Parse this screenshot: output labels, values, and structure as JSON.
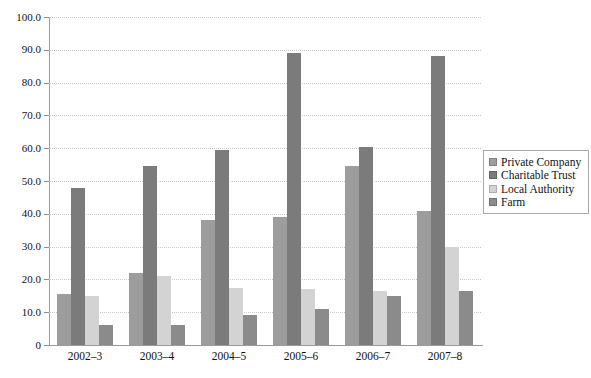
{
  "chart_data": {
    "type": "bar",
    "title": "",
    "subtitle": "",
    "xlabel": "",
    "ylabel": "",
    "categories": [
      "2002–3",
      "2003–4",
      "2004–5",
      "2005–6",
      "2006–7",
      "2007–8"
    ],
    "series": [
      {
        "name": "Private Company",
        "color": "#9d9d9d",
        "values": [
          15.5,
          22.0,
          38.0,
          39.0,
          54.5,
          41.0
        ]
      },
      {
        "name": "Charitable Trust",
        "color": "#7b7b7b",
        "values": [
          48.0,
          54.5,
          59.5,
          89.0,
          60.5,
          88.0
        ]
      },
      {
        "name": "Local Authority",
        "color": "#d3d3d3",
        "values": [
          15.0,
          21.0,
          17.5,
          17.0,
          16.5,
          30.0
        ]
      },
      {
        "name": "Farm",
        "color": "#8b8b8b",
        "values": [
          6.0,
          6.0,
          9.0,
          11.0,
          15.0,
          16.5
        ]
      }
    ],
    "ylim": [
      0,
      100
    ],
    "yticks": [
      0,
      10,
      20,
      30,
      40,
      50,
      60,
      70,
      80,
      90,
      100
    ],
    "ytick_labels": [
      "0",
      "10.0",
      "20.0",
      "30.0",
      "40.0",
      "50.0",
      "60.0",
      "70.0",
      "80.0",
      "90.0",
      "100.0"
    ],
    "grid": true,
    "grid_axis": "y",
    "grid_style": "dotted",
    "legend_position": "right",
    "legend_entries": [
      "Private Company",
      "Charitable Trust",
      "Local Authority",
      "Farm"
    ],
    "background_color": "#ffffff",
    "axis_color": "#9a9a9a"
  }
}
